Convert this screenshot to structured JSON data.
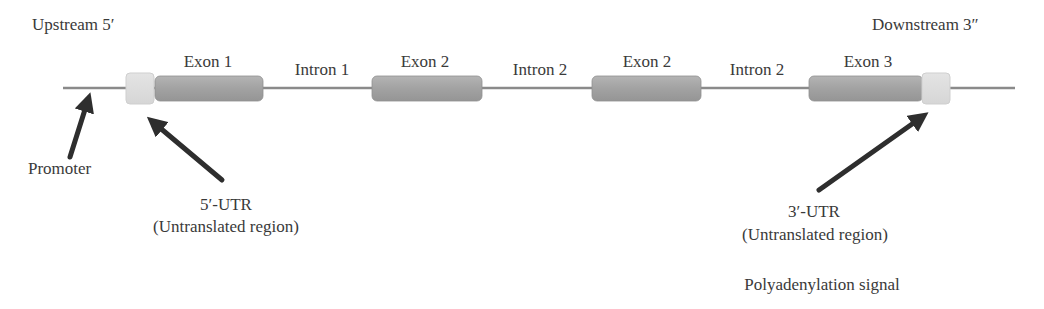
{
  "diagram": {
    "title_left": "Upstream 5′",
    "title_right": "Downstream 3″",
    "colors": {
      "backbone": "#8a8a8a",
      "exon_fill": "#a3a3a3",
      "exon_edge": "#8f8f8f",
      "utr_fill": "#dcdcdc",
      "utr_edge": "#cfcfcf",
      "arrow": "#2e2e2e",
      "text": "#3a3a3a"
    },
    "segments": [
      {
        "type": "utr",
        "label": "5′-UTR"
      },
      {
        "type": "exon",
        "label": "Exon 1"
      },
      {
        "type": "intron",
        "label": "Intron 1"
      },
      {
        "type": "exon",
        "label": "Exon 2"
      },
      {
        "type": "intron",
        "label": "Intron 2"
      },
      {
        "type": "exon",
        "label": "Exon 2"
      },
      {
        "type": "intron",
        "label": "Intron 2"
      },
      {
        "type": "exon",
        "label": "Exon 3"
      },
      {
        "type": "utr",
        "label": "3′-UTR"
      }
    ],
    "labels": {
      "exon1": "Exon 1",
      "intron1": "Intron 1",
      "exon2a": "Exon 2",
      "intron2a": "Intron 2",
      "exon2b": "Exon 2",
      "intron2b": "Intron 2",
      "exon3": "Exon 3"
    },
    "annotations": {
      "promoter": "Promoter",
      "utr5_line1": "5′-UTR",
      "utr5_line2": "(Untranslated region)",
      "utr3_line1": "3′-UTR",
      "utr3_line2": "(Untranslated region)",
      "polyadenylation": "Polyadenylation signal"
    }
  }
}
